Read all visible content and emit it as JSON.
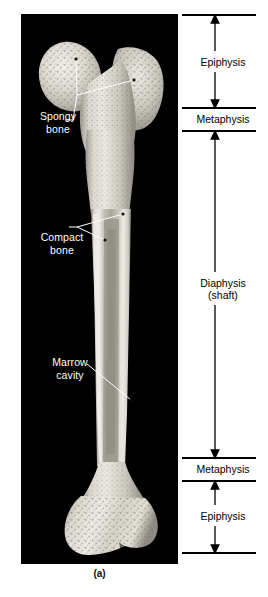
{
  "figure": {
    "caption": "(a)",
    "panel_background": "#000000",
    "page_background": "#ffffff"
  },
  "photo_labels": [
    {
      "name": "spongy-bone",
      "text": "Spongy\nbone",
      "color": "#ffffff"
    },
    {
      "name": "compact-bone",
      "text": "Compact\nbone",
      "color": "#ffffff"
    },
    {
      "name": "marrow-cavity",
      "text": "Marrow\ncavity",
      "color": "#ffffff"
    }
  ],
  "regions": [
    {
      "name": "epiphysis-proximal",
      "label": "Epiphysis",
      "type": "arrow-span"
    },
    {
      "name": "metaphysis-proximal",
      "label": "Metaphysis",
      "type": "band"
    },
    {
      "name": "diaphysis",
      "label": "Diaphysis\n(shaft)",
      "type": "arrow-span"
    },
    {
      "name": "metaphysis-distal",
      "label": "Metaphysis",
      "type": "band"
    },
    {
      "name": "epiphysis-distal",
      "label": "Epiphysis",
      "type": "arrow-span"
    }
  ],
  "colors": {
    "bracket_line": "#000000",
    "label_text": "#000000",
    "photo_label_text": "#ffffff",
    "bone_light": "#e8e6e0",
    "bone_mid": "#c9c6bd",
    "bone_dark": "#9a968c"
  }
}
